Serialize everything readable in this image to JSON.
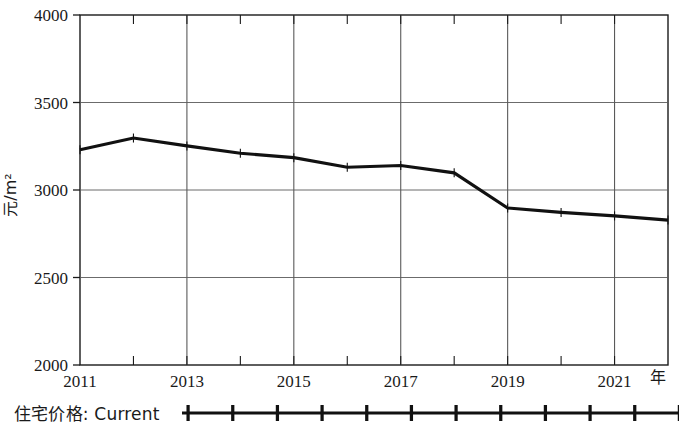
{
  "chart_data": {
    "type": "line",
    "title": "",
    "xlabel": "年",
    "ylabel": "元/m2",
    "ylabel_display": "元/m²",
    "x": [
      2011,
      2012,
      2013,
      2014,
      2015,
      2016,
      2017,
      2018,
      2019,
      2020,
      2021,
      2022
    ],
    "xticklabels": [
      "2011",
      "2013",
      "2015",
      "2017",
      "2019",
      "2021"
    ],
    "xticks": [
      2011,
      2013,
      2015,
      2017,
      2019,
      2021
    ],
    "yticklabels": [
      "2000",
      "2500",
      "3000",
      "3500",
      "4000"
    ],
    "yticks": [
      2000,
      2500,
      3000,
      3500,
      4000
    ],
    "ylim": [
      2000,
      4000
    ],
    "xlim": [
      2011,
      2022
    ],
    "grid": true,
    "legend_position": "below-axes-left",
    "series": [
      {
        "name": "住宅价格: Current",
        "color": "#111111",
        "marker": "plus",
        "values": [
          3230,
          3297,
          3252,
          3210,
          3185,
          3130,
          3140,
          3098,
          2897,
          2872,
          2852,
          2828
        ]
      }
    ]
  },
  "axes": {
    "y_axis_label": "元/m²",
    "x_axis_label": "年",
    "y_ticks": [
      "4000",
      "3500",
      "3000",
      "2500",
      "2000"
    ],
    "x_ticks": [
      "2011",
      "2013",
      "2015",
      "2017",
      "2019",
      "2021"
    ]
  },
  "legend": {
    "label": "住宅价格: Current"
  }
}
